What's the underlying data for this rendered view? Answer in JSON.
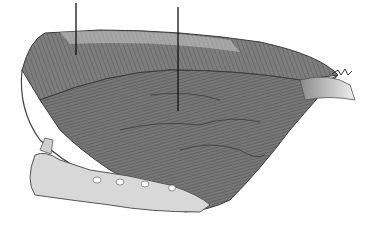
{
  "figure": {
    "style": "grayscale pencil drawing",
    "colors": {
      "background": "#ffffff",
      "muscle_dark": "#5a5a5a",
      "muscle_mid": "#8a8a8a",
      "muscle_light": "#c8c8c8",
      "bone": "#d6d6d6",
      "outline": "#3a3a3a",
      "leader_line": "#111111"
    },
    "leader_lines": [
      {
        "x": 76,
        "y1": 3,
        "y2": 55
      },
      {
        "x": 178,
        "y1": 7,
        "y2": 111
      }
    ],
    "labels": []
  }
}
